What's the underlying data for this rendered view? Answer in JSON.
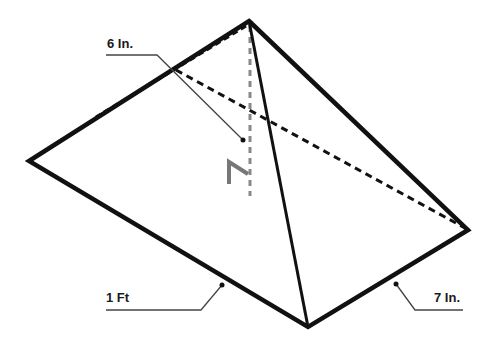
{
  "figure": {
    "type": "rectangular pyramid",
    "vertices": {
      "apex": [
        249,
        21
      ],
      "left": [
        29,
        161
      ],
      "right": [
        468,
        230
      ],
      "bottom": [
        308,
        327
      ],
      "back_hidden": [
        176,
        70
      ],
      "base_center": [
        250,
        196
      ]
    },
    "labels": {
      "height": "6 In.",
      "length": "1 Ft",
      "width": "7 In."
    },
    "colors": {
      "edge": "#111111",
      "hidden_edge": "#111111",
      "height_line": "#888888",
      "right_angle_marker": "#777777",
      "leader": "#444444"
    }
  }
}
